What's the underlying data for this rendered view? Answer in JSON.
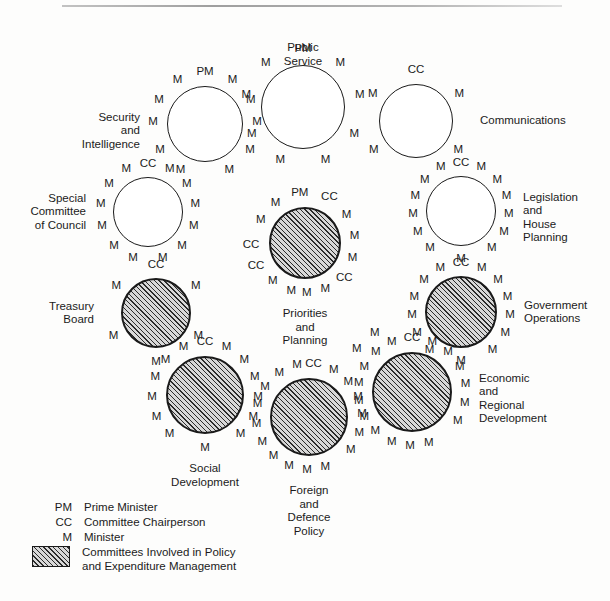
{
  "diagram": {
    "type": "cabinet-committee-structure",
    "style": {
      "ink": "#1b1b1b",
      "hatch": "#2b2b2b",
      "plain_fill": "#ffffff",
      "hatched_fill": "#d8d8d8"
    },
    "committees": [
      {
        "id": "public-service",
        "label": "Public Service",
        "label_position": "above",
        "hatched": false,
        "cx": 303,
        "cy": 107,
        "r": 42,
        "chair": "PM",
        "member_count": 8,
        "slots": [
          {
            "t": "PM",
            "a": -90,
            "rr": 58
          },
          {
            "t": "M",
            "a": -130,
            "rr": 58
          },
          {
            "t": "M",
            "a": -50,
            "rr": 58
          },
          {
            "t": "M",
            "a": -168,
            "rr": 58
          },
          {
            "t": "M",
            "a": -12,
            "rr": 58
          },
          {
            "t": "M",
            "a": 152,
            "rr": 58
          },
          {
            "t": "M",
            "a": 28,
            "rr": 58
          },
          {
            "t": "M",
            "a": 113,
            "rr": 58
          },
          {
            "t": "M",
            "a": 67,
            "rr": 58
          }
        ]
      },
      {
        "id": "security-and-intelligence",
        "label": "Security and\nIntelligence",
        "label_position": "left",
        "hatched": false,
        "cx": 205,
        "cy": 124,
        "r": 38,
        "chair": "PM",
        "member_count": 10,
        "slots": [
          {
            "t": "PM",
            "a": -90,
            "rr": 52
          },
          {
            "t": "M",
            "a": -122,
            "rr": 52
          },
          {
            "t": "M",
            "a": -58,
            "rr": 52
          },
          {
            "t": "M",
            "a": -152,
            "rr": 52
          },
          {
            "t": "M",
            "a": -28,
            "rr": 52
          },
          {
            "t": "M",
            "a": -178,
            "rr": 52
          },
          {
            "t": "M",
            "a": -2,
            "rr": 52
          },
          {
            "t": "M",
            "a": 150,
            "rr": 52
          },
          {
            "t": "M",
            "a": 30,
            "rr": 52
          },
          {
            "t": "M",
            "a": 118,
            "rr": 52
          },
          {
            "t": "M",
            "a": 62,
            "rr": 52
          }
        ]
      },
      {
        "id": "communications",
        "label": "Communications",
        "label_position": "right",
        "hatched": false,
        "cx": 416,
        "cy": 121,
        "r": 37,
        "chair": "CC",
        "member_count": 4,
        "slots": [
          {
            "t": "CC",
            "a": -90,
            "rr": 51
          },
          {
            "t": "M",
            "a": -148,
            "rr": 51
          },
          {
            "t": "M",
            "a": -32,
            "rr": 51
          },
          {
            "t": "M",
            "a": 146,
            "rr": 51
          },
          {
            "t": "M",
            "a": 34,
            "rr": 51
          }
        ]
      },
      {
        "id": "special-committee-of-council",
        "label": "Special\nCommittee\nof Council",
        "label_position": "left",
        "hatched": false,
        "cx": 148,
        "cy": 212,
        "r": 35,
        "chair": "CC",
        "member_count": 12,
        "slots": [
          {
            "t": "CC",
            "a": -90,
            "rr": 48
          },
          {
            "t": "M",
            "a": -117,
            "rr": 48
          },
          {
            "t": "M",
            "a": -63,
            "rr": 48
          },
          {
            "t": "M",
            "a": -144,
            "rr": 48
          },
          {
            "t": "M",
            "a": -36,
            "rr": 48
          },
          {
            "t": "M",
            "a": -170,
            "rr": 48
          },
          {
            "t": "M",
            "a": -10,
            "rr": 48
          },
          {
            "t": "M",
            "a": 163,
            "rr": 48
          },
          {
            "t": "M",
            "a": 17,
            "rr": 48
          },
          {
            "t": "M",
            "a": 135,
            "rr": 48
          },
          {
            "t": "M",
            "a": 45,
            "rr": 48
          },
          {
            "t": "M",
            "a": 108,
            "rr": 48
          },
          {
            "t": "M",
            "a": 72,
            "rr": 48
          }
        ]
      },
      {
        "id": "legislation-and-house-planning",
        "label": "Legislation\nand House\nPlanning",
        "label_position": "right",
        "hatched": false,
        "cx": 461,
        "cy": 211,
        "r": 35,
        "chair": "CC",
        "member_count": 13,
        "slots": [
          {
            "t": "CC",
            "a": -90,
            "rr": 48
          },
          {
            "t": "M",
            "a": -115,
            "rr": 48
          },
          {
            "t": "M",
            "a": -65,
            "rr": 48
          },
          {
            "t": "M",
            "a": -139,
            "rr": 48
          },
          {
            "t": "M",
            "a": -41,
            "rr": 48
          },
          {
            "t": "M",
            "a": -162,
            "rr": 48
          },
          {
            "t": "M",
            "a": -18,
            "rr": 48
          },
          {
            "t": "M",
            "a": 176,
            "rr": 48
          },
          {
            "t": "M",
            "a": 4,
            "rr": 48
          },
          {
            "t": "M",
            "a": 154,
            "rr": 48
          },
          {
            "t": "M",
            "a": 26,
            "rr": 48
          },
          {
            "t": "M",
            "a": 130,
            "rr": 48
          },
          {
            "t": "M",
            "a": 50,
            "rr": 48
          },
          {
            "t": "M",
            "a": 90,
            "rr": 48
          }
        ]
      },
      {
        "id": "priorities-and-planning",
        "label": "Priorities and\nPlanning",
        "label_position": "below",
        "hatched": true,
        "cx": 305,
        "cy": 243,
        "r": 36,
        "chair": "PM",
        "member_count": 9,
        "slots": [
          {
            "t": "PM",
            "a": -96,
            "rr": 50
          },
          {
            "t": "CC",
            "a": -62,
            "rr": 52
          },
          {
            "t": "M",
            "a": -126,
            "rr": 50
          },
          {
            "t": "M",
            "a": -34,
            "rr": 50
          },
          {
            "t": "M",
            "a": -152,
            "rr": 50
          },
          {
            "t": "M",
            "a": -8,
            "rr": 50
          },
          {
            "t": "CC",
            "a": 178,
            "rr": 54
          },
          {
            "t": "M",
            "a": 18,
            "rr": 50
          },
          {
            "t": "CC",
            "a": 155,
            "rr": 54
          },
          {
            "t": "CC",
            "a": 42,
            "rr": 53
          },
          {
            "t": "M",
            "a": 130,
            "rr": 50
          },
          {
            "t": "M",
            "a": 106,
            "rr": 50
          },
          {
            "t": "M",
            "a": 88,
            "rr": 50
          },
          {
            "t": "M",
            "a": 66,
            "rr": 50
          }
        ]
      },
      {
        "id": "treasury-board",
        "label": "Treasury\nBoard",
        "label_position": "left",
        "hatched": true,
        "cx": 156,
        "cy": 313,
        "r": 35,
        "chair": "CC",
        "member_count": 5,
        "slots": [
          {
            "t": "CC",
            "a": -90,
            "rr": 48
          },
          {
            "t": "M",
            "a": -146,
            "rr": 48
          },
          {
            "t": "M",
            "a": -34,
            "rr": 48
          },
          {
            "t": "M",
            "a": 152,
            "rr": 48
          },
          {
            "t": "M",
            "a": 28,
            "rr": 48
          },
          {
            "t": "M",
            "a": 90,
            "rr": 49
          }
        ]
      },
      {
        "id": "government-operations",
        "label": "Government\nOperations",
        "label_position": "right",
        "hatched": true,
        "cx": 461,
        "cy": 312,
        "r": 36,
        "chair": "CC",
        "member_count": 13,
        "slots": [
          {
            "t": "CC",
            "a": -90,
            "rr": 49
          },
          {
            "t": "M",
            "a": -115,
            "rr": 49
          },
          {
            "t": "M",
            "a": -65,
            "rr": 49
          },
          {
            "t": "M",
            "a": -139,
            "rr": 49
          },
          {
            "t": "M",
            "a": -41,
            "rr": 49
          },
          {
            "t": "M",
            "a": -162,
            "rr": 49
          },
          {
            "t": "M",
            "a": -18,
            "rr": 49
          },
          {
            "t": "M",
            "a": 177,
            "rr": 49
          },
          {
            "t": "M",
            "a": 3,
            "rr": 49
          },
          {
            "t": "M",
            "a": 154,
            "rr": 49
          },
          {
            "t": "M",
            "a": 25,
            "rr": 49
          },
          {
            "t": "M",
            "a": 130,
            "rr": 49
          },
          {
            "t": "M",
            "a": 50,
            "rr": 49
          },
          {
            "t": "M",
            "a": 90,
            "rr": 49
          }
        ]
      },
      {
        "id": "social-development",
        "label": "Social\nDevelopment",
        "label_position": "below",
        "hatched": true,
        "cx": 205,
        "cy": 395,
        "r": 39,
        "chair": "CC",
        "member_count": 13,
        "slots": [
          {
            "t": "CC",
            "a": -90,
            "rr": 53
          },
          {
            "t": "M",
            "a": -114,
            "rr": 53
          },
          {
            "t": "M",
            "a": -66,
            "rr": 53
          },
          {
            "t": "M",
            "a": -138,
            "rr": 53
          },
          {
            "t": "M",
            "a": -42,
            "rr": 53
          },
          {
            "t": "M",
            "a": -160,
            "rr": 53
          },
          {
            "t": "M",
            "a": -20,
            "rr": 53
          },
          {
            "t": "M",
            "a": 178,
            "rr": 53
          },
          {
            "t": "M",
            "a": 2,
            "rr": 53
          },
          {
            "t": "M",
            "a": 156,
            "rr": 53
          },
          {
            "t": "M",
            "a": 24,
            "rr": 53
          },
          {
            "t": "M",
            "a": 132,
            "rr": 53
          },
          {
            "t": "M",
            "a": 48,
            "rr": 53
          },
          {
            "t": "M",
            "a": 90,
            "rr": 53
          }
        ]
      },
      {
        "id": "foreign-and-defence-policy",
        "label": "Foreign and\nDefence Policy",
        "label_position": "below",
        "hatched": true,
        "cx": 309,
        "cy": 417,
        "r": 39,
        "chair": "CC",
        "member_count": 15,
        "slots": [
          {
            "t": "CC",
            "a": -85,
            "rr": 53
          },
          {
            "t": "M",
            "a": -103,
            "rr": 53
          },
          {
            "t": "M",
            "a": -62,
            "rr": 53
          },
          {
            "t": "M",
            "a": -124,
            "rr": 53
          },
          {
            "t": "M",
            "a": -42,
            "rr": 53
          },
          {
            "t": "M",
            "a": -146,
            "rr": 53
          },
          {
            "t": "M",
            "a": -22,
            "rr": 53
          },
          {
            "t": "M",
            "a": -166,
            "rr": 53
          },
          {
            "t": "M",
            "a": -3,
            "rr": 53
          },
          {
            "t": "M",
            "a": 172,
            "rr": 53
          },
          {
            "t": "M",
            "a": 18,
            "rr": 53
          },
          {
            "t": "M",
            "a": 152,
            "rr": 53
          },
          {
            "t": "M",
            "a": 38,
            "rr": 53
          },
          {
            "t": "M",
            "a": 132,
            "rr": 53
          },
          {
            "t": "M",
            "a": 112,
            "rr": 53
          },
          {
            "t": "M",
            "a": 92,
            "rr": 53
          },
          {
            "t": "M",
            "a": 72,
            "rr": 53
          }
        ]
      },
      {
        "id": "economic-and-regional-development",
        "label": "Economic and\nRegional\nDevelopment",
        "label_position": "right",
        "hatched": true,
        "cx": 412,
        "cy": 392,
        "r": 40,
        "chair": "CC",
        "member_count": 17,
        "slots": [
          {
            "t": "CC",
            "a": -90,
            "rr": 54
          },
          {
            "t": "M",
            "a": -112,
            "rr": 54
          },
          {
            "t": "M",
            "a": -68,
            "rr": 54
          },
          {
            "t": "M",
            "a": -132,
            "rr": 54
          },
          {
            "t": "M",
            "a": -48,
            "rr": 54
          },
          {
            "t": "M",
            "a": -152,
            "rr": 54
          },
          {
            "t": "M",
            "a": -28,
            "rr": 54
          },
          {
            "t": "M",
            "a": -170,
            "rr": 54
          },
          {
            "t": "M",
            "a": -8,
            "rr": 54
          },
          {
            "t": "M",
            "a": 170,
            "rr": 54
          },
          {
            "t": "M",
            "a": 12,
            "rr": 54
          },
          {
            "t": "M",
            "a": 152,
            "rr": 54
          },
          {
            "t": "M",
            "a": 32,
            "rr": 54
          },
          {
            "t": "M",
            "a": 133,
            "rr": 54
          },
          {
            "t": "M",
            "a": 112,
            "rr": 54
          },
          {
            "t": "M",
            "a": 92,
            "rr": 54
          },
          {
            "t": "M",
            "a": 72,
            "rr": 54
          },
          {
            "t": "M",
            "a": -122,
            "rr": 70
          },
          {
            "t": "M",
            "a": -142,
            "rr": 70
          }
        ]
      }
    ]
  },
  "legend": {
    "rows": [
      {
        "key": "PM",
        "text": "Prime Minister",
        "swatch": false
      },
      {
        "key": "CC",
        "text": "Committee Chairperson",
        "swatch": false
      },
      {
        "key": "M",
        "text": "Minister",
        "swatch": false
      },
      {
        "key": "",
        "text": "Committees Involved in Policy\nand Expenditure Management",
        "swatch": true
      }
    ]
  }
}
